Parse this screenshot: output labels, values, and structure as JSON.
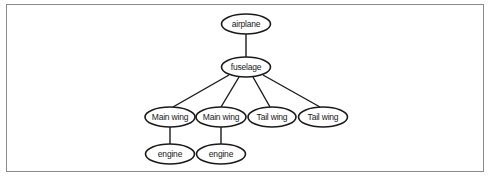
{
  "diagram": {
    "type": "tree",
    "title": "",
    "nodes": [
      {
        "id": "airplane",
        "label": "airplane",
        "cx": 246,
        "cy": 24,
        "rx": 24.5,
        "ry": 10
      },
      {
        "id": "fuselage",
        "label": "fuselage",
        "cx": 246,
        "cy": 67,
        "rx": 24.5,
        "ry": 10
      },
      {
        "id": "main_wing_1",
        "label": "Main wing",
        "cx": 170,
        "cy": 117,
        "rx": 25,
        "ry": 10
      },
      {
        "id": "main_wing_2",
        "label": "Main wing",
        "cx": 221,
        "cy": 117,
        "rx": 25,
        "ry": 10
      },
      {
        "id": "tail_wing_1",
        "label": "Tail wing",
        "cx": 272,
        "cy": 117,
        "rx": 24,
        "ry": 10
      },
      {
        "id": "tail_wing_2",
        "label": "Tail wing",
        "cx": 323,
        "cy": 117,
        "rx": 24.5,
        "ry": 10
      },
      {
        "id": "engine_1",
        "label": "engine",
        "cx": 170,
        "cy": 154,
        "rx": 24.5,
        "ry": 10
      },
      {
        "id": "engine_2",
        "label": "engine",
        "cx": 221,
        "cy": 154,
        "rx": 24.5,
        "ry": 10
      }
    ],
    "edges": [
      {
        "from": "airplane",
        "to": "fuselage",
        "x1": 246,
        "y1": 34,
        "x2": 246,
        "y2": 57
      },
      {
        "from": "fuselage",
        "to": "main_wing_1",
        "x1": 229,
        "y1": 75,
        "x2": 173,
        "y2": 107
      },
      {
        "from": "fuselage",
        "to": "main_wing_2",
        "x1": 239,
        "y1": 77,
        "x2": 221,
        "y2": 107
      },
      {
        "from": "fuselage",
        "to": "tail_wing_1",
        "x1": 253,
        "y1": 77,
        "x2": 270,
        "y2": 107
      },
      {
        "from": "fuselage",
        "to": "tail_wing_2",
        "x1": 263,
        "y1": 75,
        "x2": 320,
        "y2": 107
      },
      {
        "from": "main_wing_1",
        "to": "engine_1",
        "x1": 170,
        "y1": 127,
        "x2": 170,
        "y2": 144
      },
      {
        "from": "main_wing_2",
        "to": "engine_2",
        "x1": 221,
        "y1": 127,
        "x2": 221,
        "y2": 144
      }
    ]
  }
}
